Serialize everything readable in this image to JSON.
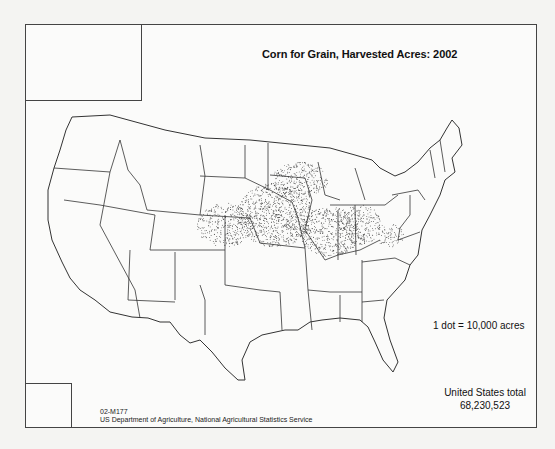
{
  "map": {
    "title": "Corn for Grain, Harvested Acres: 2002",
    "legend": "1 dot = 10,000 acres",
    "total_label": "United States total",
    "total_value": "68,230,523",
    "map_code": "02-M177",
    "source": "US Department of Agriculture, National Agricultural Statistics Service",
    "insets": [
      "Alaska",
      "Hawaii"
    ],
    "colors": {
      "border": "#333333",
      "county": "#bbbbbb",
      "dot": "#222222",
      "background": "#fbfbfa"
    }
  }
}
